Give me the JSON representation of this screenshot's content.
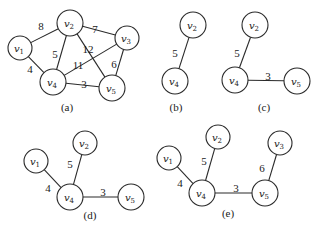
{
  "figure": {
    "colors": {
      "stroke": "#2a2a2a",
      "text": "#1a1a1a",
      "background": "#ffffff"
    },
    "panels": [
      {
        "id": "a",
        "caption": "(a)",
        "caption_pos": [
          67,
          111
        ],
        "nodes": [
          {
            "id": "v1",
            "base": "v",
            "sub": "1",
            "x": 20,
            "y": 48,
            "r": 12
          },
          {
            "id": "v2",
            "base": "v",
            "sub": "2",
            "x": 70,
            "y": 23,
            "r": 13
          },
          {
            "id": "v3",
            "base": "v",
            "sub": "3",
            "x": 127,
            "y": 38,
            "r": 12
          },
          {
            "id": "v4",
            "base": "v",
            "sub": "4",
            "x": 53,
            "y": 82,
            "r": 13
          },
          {
            "id": "v5",
            "base": "v",
            "sub": "5",
            "x": 112,
            "y": 88,
            "r": 13
          }
        ],
        "edges": [
          {
            "from": "v1",
            "to": "v2",
            "weight": "8",
            "label_pos": [
              41,
              27
            ]
          },
          {
            "from": "v1",
            "to": "v4",
            "weight": "4",
            "label_pos": [
              30,
              70
            ]
          },
          {
            "from": "v2",
            "to": "v4",
            "weight": "5",
            "label_pos": [
              55,
              55
            ]
          },
          {
            "from": "v2",
            "to": "v3",
            "weight": "7",
            "label_pos": [
              95,
              30
            ]
          },
          {
            "from": "v2",
            "to": "v5",
            "weight": "12",
            "label_pos": [
              88,
              50
            ]
          },
          {
            "from": "v4",
            "to": "v3",
            "weight": "11",
            "label_pos": [
              78,
              66
            ]
          },
          {
            "from": "v3",
            "to": "v5",
            "weight": "6",
            "label_pos": [
              114,
              65
            ]
          },
          {
            "from": "v4",
            "to": "v5",
            "weight": "3",
            "label_pos": [
              84,
              85
            ]
          }
        ]
      },
      {
        "id": "b",
        "caption": "(b)",
        "caption_pos": [
          176,
          111
        ],
        "nodes": [
          {
            "id": "v2",
            "base": "v",
            "sub": "2",
            "x": 193,
            "y": 25,
            "r": 13
          },
          {
            "id": "v4",
            "base": "v",
            "sub": "4",
            "x": 175,
            "y": 81,
            "r": 13
          }
        ],
        "edges": [
          {
            "from": "v2",
            "to": "v4",
            "weight": "5",
            "label_pos": [
              175,
              54
            ]
          }
        ]
      },
      {
        "id": "c",
        "caption": "(c)",
        "caption_pos": [
          264,
          111
        ],
        "nodes": [
          {
            "id": "v2",
            "base": "v",
            "sub": "2",
            "x": 255,
            "y": 25,
            "r": 13
          },
          {
            "id": "v4",
            "base": "v",
            "sub": "4",
            "x": 235,
            "y": 80,
            "r": 13
          },
          {
            "id": "v5",
            "base": "v",
            "sub": "5",
            "x": 297,
            "y": 81,
            "r": 13
          }
        ],
        "edges": [
          {
            "from": "v2",
            "to": "v4",
            "weight": "5",
            "label_pos": [
              237,
              54
            ]
          },
          {
            "from": "v4",
            "to": "v5",
            "weight": "3",
            "label_pos": [
              268,
              77
            ]
          }
        ]
      },
      {
        "id": "d",
        "caption": "(d)",
        "caption_pos": [
          90,
          219
        ],
        "nodes": [
          {
            "id": "v1",
            "base": "v",
            "sub": "1",
            "x": 36,
            "y": 161,
            "r": 12
          },
          {
            "id": "v2",
            "base": "v",
            "sub": "2",
            "x": 85,
            "y": 143,
            "r": 12
          },
          {
            "id": "v4",
            "base": "v",
            "sub": "4",
            "x": 70,
            "y": 197,
            "r": 13
          },
          {
            "id": "v5",
            "base": "v",
            "sub": "5",
            "x": 131,
            "y": 197,
            "r": 13
          }
        ],
        "edges": [
          {
            "from": "v1",
            "to": "v4",
            "weight": "4",
            "label_pos": [
              48,
              189
            ]
          },
          {
            "from": "v2",
            "to": "v4",
            "weight": "5",
            "label_pos": [
              70,
              165
            ]
          },
          {
            "from": "v4",
            "to": "v5",
            "weight": "3",
            "label_pos": [
              103,
              193
            ]
          }
        ]
      },
      {
        "id": "e",
        "caption": "(e)",
        "caption_pos": [
          228,
          217
        ],
        "nodes": [
          {
            "id": "v1",
            "base": "v",
            "sub": "1",
            "x": 169,
            "y": 158,
            "r": 12
          },
          {
            "id": "v2",
            "base": "v",
            "sub": "2",
            "x": 218,
            "y": 137,
            "r": 12
          },
          {
            "id": "v3",
            "base": "v",
            "sub": "3",
            "x": 280,
            "y": 143,
            "r": 12
          },
          {
            "id": "v4",
            "base": "v",
            "sub": "4",
            "x": 202,
            "y": 193,
            "r": 13
          },
          {
            "id": "v5",
            "base": "v",
            "sub": "5",
            "x": 265,
            "y": 193,
            "r": 13
          }
        ],
        "edges": [
          {
            "from": "v1",
            "to": "v4",
            "weight": "4",
            "label_pos": [
              180,
              184
            ]
          },
          {
            "from": "v2",
            "to": "v4",
            "weight": "5",
            "label_pos": [
              204,
              162
            ]
          },
          {
            "from": "v3",
            "to": "v5",
            "weight": "6",
            "label_pos": [
              262,
              169
            ]
          },
          {
            "from": "v4",
            "to": "v5",
            "weight": "3",
            "label_pos": [
              236,
              189
            ]
          }
        ]
      }
    ]
  }
}
